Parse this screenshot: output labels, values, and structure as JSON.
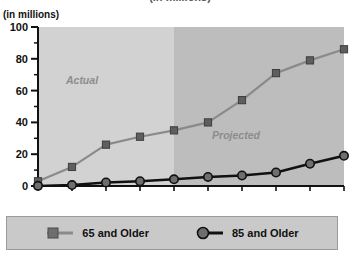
{
  "title": {
    "text": "(in millions)",
    "clipped_top_text": "(in millions)"
  },
  "axis": {
    "y_unit_label": "(in millions)"
  },
  "legend": {
    "items": [
      {
        "label": "65 and Older",
        "marker": "square",
        "color": "#6e6e6e"
      },
      {
        "label": "85 and Older",
        "marker": "circle",
        "color": "#1a1a1a"
      }
    ]
  },
  "annotations": [
    {
      "text": "Actual",
      "region": "historical"
    },
    {
      "text": "Projected",
      "region": "forecast"
    }
  ],
  "colors": {
    "series_65": "#6e6e6e",
    "series_85": "#111111",
    "band_actual": "#d2d2d2",
    "band_projected": "#bdbdbd",
    "legend_band": "#c9c9c9",
    "axis": "#111111",
    "annotation_text": "#8c8c8c"
  },
  "chart_data": {
    "type": "line",
    "title": "(in millions)",
    "xlabel": "",
    "ylabel": "(in millions)",
    "ylim": [
      0,
      100
    ],
    "yticks": [
      0,
      20,
      40,
      60,
      80,
      100
    ],
    "yticks_minor": [
      10,
      30,
      50,
      70,
      90
    ],
    "grid": false,
    "legend_position": "bottom",
    "categories": [
      "1900",
      "1950",
      "1980",
      "1990",
      "2000",
      "2010",
      "2020",
      "2030",
      "2040",
      "2050"
    ],
    "series": [
      {
        "name": "65 and Older",
        "marker": "square",
        "color": "#6e6e6e",
        "values": [
          3,
          12,
          26,
          31,
          35,
          40,
          54,
          71,
          79,
          86
        ]
      },
      {
        "name": "85 and Older",
        "marker": "circle",
        "color": "#111111",
        "values": [
          0.1,
          0.6,
          2.2,
          3.0,
          4.2,
          5.7,
          6.6,
          8.5,
          14,
          19
        ]
      }
    ],
    "regions": [
      {
        "label": "Actual",
        "from": "1900",
        "to": "2000",
        "shade": "#d2d2d2"
      },
      {
        "label": "Projected",
        "from": "2000",
        "to": "2050",
        "shade": "#bdbdbd"
      }
    ]
  }
}
